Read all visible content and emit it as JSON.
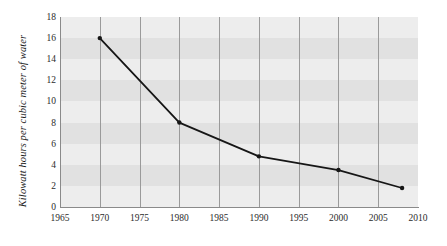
{
  "chart_data": {
    "type": "line",
    "title": "",
    "xlabel": "",
    "ylabel": "Kilowatt hours per cubic meter of water",
    "x": [
      1970,
      1980,
      1990,
      2000,
      2008
    ],
    "values": [
      16,
      8,
      4.8,
      3.5,
      1.8
    ],
    "series": [
      {
        "name": "Kilowatt hours per cubic meter of water",
        "x": [
          1970,
          1980,
          1990,
          2000,
          2008
        ],
        "values": [
          16,
          8,
          4.8,
          3.5,
          1.8
        ]
      }
    ],
    "xlim": [
      1965,
      2010
    ],
    "ylim": [
      0,
      18
    ],
    "xticks": [
      1965,
      1970,
      1975,
      1980,
      1985,
      1990,
      1995,
      2000,
      2005,
      2010
    ],
    "yticks": [
      0,
      2,
      4,
      6,
      8,
      10,
      12,
      14,
      16,
      18
    ],
    "xtick_labels": [
      "1965",
      "1970",
      "1975",
      "1980",
      "1985",
      "1990",
      "1995",
      "2000",
      "2005",
      "2010"
    ],
    "ytick_labels": [
      "0",
      "2",
      "4",
      "6",
      "8",
      "10",
      "12",
      "14",
      "16",
      "18"
    ],
    "grid": "vertical",
    "legend": "none",
    "banding": "alternating horizontal bands every 2 units",
    "colors": {
      "line": "#161616",
      "marker": "#161616",
      "plot_background_light": "#ededed",
      "plot_background_band": "#e1e1e1",
      "gridline": "#9a9a9a",
      "axis": "#8a8a8a",
      "tick_label": "#2b2b2b",
      "page_background": "#ffffff"
    }
  }
}
